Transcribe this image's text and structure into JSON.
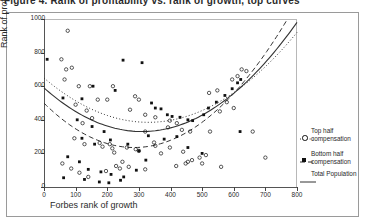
{
  "title": {
    "text": "Figure 4. Rank of profitability vs. rank of growth, top curves"
  },
  "axes": {
    "ylabel": "Rank of profitability",
    "xlabel": "Forbes rank of growth",
    "yticks": [
      0,
      200,
      400,
      600,
      800,
      1000
    ],
    "xticks": [
      0,
      100,
      200,
      300,
      400,
      500,
      600,
      700,
      800
    ],
    "xlim": [
      0,
      800
    ],
    "ylim": [
      0,
      1000
    ]
  },
  "legend": {
    "items": [
      {
        "line": "dotted",
        "marker": "open-circle",
        "label_1": "Top half",
        "label_2": "compensation"
      },
      {
        "line": "dashed",
        "marker": "filled-square",
        "label_1": "Bottom half",
        "label_2": "compensation"
      },
      {
        "line": "solid",
        "marker": "none",
        "label_1": "Total Population",
        "label_2": ""
      }
    ]
  },
  "chart_data": {
    "type": "scatter",
    "title": "Figure 4. Rank of profitability vs. rank of growth, top curves",
    "xlabel": "Forbes rank of growth",
    "ylabel": "Rank of profitability",
    "xlim": [
      0,
      800
    ],
    "ylim": [
      0,
      1000
    ],
    "grid": false,
    "legend_position": "right",
    "series": [
      {
        "name": "Top half compensation",
        "marker": "open-circle",
        "points": [
          [
            75,
            930
          ],
          [
            55,
            760
          ],
          [
            70,
            700
          ],
          [
            88,
            710
          ],
          [
            65,
            640
          ],
          [
            110,
            600
          ],
          [
            145,
            600
          ],
          [
            218,
            600
          ],
          [
            170,
            520
          ],
          [
            200,
            520
          ],
          [
            100,
            490
          ],
          [
            288,
            540
          ],
          [
            300,
            520
          ],
          [
            272,
            460
          ],
          [
            320,
            430
          ],
          [
            135,
            455
          ],
          [
            152,
            410
          ],
          [
            122,
            380
          ],
          [
            320,
            330
          ],
          [
            352,
            415
          ],
          [
            398,
            395
          ],
          [
            420,
            380
          ],
          [
            392,
            355
          ],
          [
            436,
            340
          ],
          [
            462,
            330
          ],
          [
            96,
            290
          ],
          [
            128,
            255
          ],
          [
            176,
            262
          ],
          [
            185,
            240
          ],
          [
            208,
            255
          ],
          [
            216,
            230
          ],
          [
            222,
            205
          ],
          [
            262,
            235
          ],
          [
            290,
            225
          ],
          [
            300,
            215
          ],
          [
            348,
            265
          ],
          [
            352,
            245
          ],
          [
            370,
            200
          ],
          [
            398,
            235
          ],
          [
            440,
            210
          ],
          [
            455,
            150
          ],
          [
            500,
            140
          ],
          [
            525,
            330
          ],
          [
            556,
            450
          ],
          [
            578,
            505
          ],
          [
            595,
            640
          ],
          [
            612,
            660
          ],
          [
            625,
            700
          ],
          [
            640,
            690
          ],
          [
            522,
            560
          ],
          [
            548,
            575
          ],
          [
            600,
            470
          ],
          [
            660,
            330
          ],
          [
            700,
            175
          ],
          [
            560,
            120
          ],
          [
            58,
            140
          ],
          [
            86,
            110
          ],
          [
            112,
            85
          ],
          [
            140,
            60
          ],
          [
            196,
            95
          ],
          [
            240,
            110
          ],
          [
            268,
            120
          ],
          [
            228,
            125
          ],
          [
            248,
            150
          ],
          [
            320,
            105
          ],
          [
            418,
            125
          ],
          [
            448,
            140
          ],
          [
            468,
            160
          ],
          [
            492,
            175
          ],
          [
            512,
            190
          ]
        ]
      },
      {
        "name": "Bottom half compensation",
        "marker": "filled-square",
        "points": [
          [
            10,
            760
          ],
          [
            250,
            755
          ],
          [
            310,
            740
          ],
          [
            155,
            600
          ],
          [
            225,
            575
          ],
          [
            60,
            530
          ],
          [
            120,
            525
          ],
          [
            340,
            500
          ],
          [
            352,
            470
          ],
          [
            370,
            465
          ],
          [
            390,
            430
          ],
          [
            405,
            420
          ],
          [
            430,
            415
          ],
          [
            455,
            400
          ],
          [
            470,
            395
          ],
          [
            505,
            430
          ],
          [
            520,
            470
          ],
          [
            545,
            505
          ],
          [
            572,
            545
          ],
          [
            595,
            585
          ],
          [
            612,
            620
          ],
          [
            622,
            640
          ],
          [
            105,
            400
          ],
          [
            152,
            360
          ],
          [
            190,
            330
          ],
          [
            120,
            290
          ],
          [
            160,
            255
          ],
          [
            210,
            280
          ],
          [
            265,
            255
          ],
          [
            300,
            215
          ],
          [
            330,
            305
          ],
          [
            380,
            285
          ],
          [
            420,
            300
          ],
          [
            455,
            235
          ],
          [
            500,
            200
          ],
          [
            620,
            330
          ],
          [
            75,
            180
          ],
          [
            112,
            150
          ],
          [
            140,
            105
          ],
          [
            180,
            90
          ],
          [
            212,
            75
          ],
          [
            252,
            60
          ],
          [
            292,
            100
          ],
          [
            322,
            160
          ],
          [
            128,
            45
          ],
          [
            175,
            30
          ],
          [
            205,
            25
          ],
          [
            242,
            40
          ],
          [
            62,
            55
          ]
        ]
      }
    ],
    "trend_curves": [
      {
        "name": "Top half compensation",
        "style": "dotted",
        "fit": "quadratic",
        "description": "minimum near x=330, y=385; rises to ~920 at x=800; starts ~460 at x=0"
      },
      {
        "name": "Total Population",
        "style": "solid",
        "fit": "quadratic",
        "description": "minimum near x=310, y=330; rises to ~980 at x=800; starts ~405 at x=0"
      },
      {
        "name": "Bottom half compensation",
        "style": "dashed",
        "fit": "quadratic",
        "description": "minimum near x=285, y=235; rises steeply past x=600; starts ~345 at x=0"
      }
    ]
  }
}
